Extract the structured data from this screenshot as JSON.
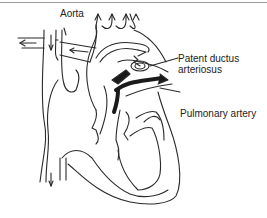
{
  "diagram": {
    "labels": {
      "aorta": "Aorta",
      "patent_ductus_line1": "Patent ductus",
      "patent_ductus_line2": "arteriosus",
      "pulmonary_artery": "Pulmonary artery"
    },
    "colors": {
      "stroke": "#2a2a2a",
      "fill_dark": "#1a1a1a",
      "border": "#9a9a9a",
      "background": "#ffffff"
    }
  }
}
